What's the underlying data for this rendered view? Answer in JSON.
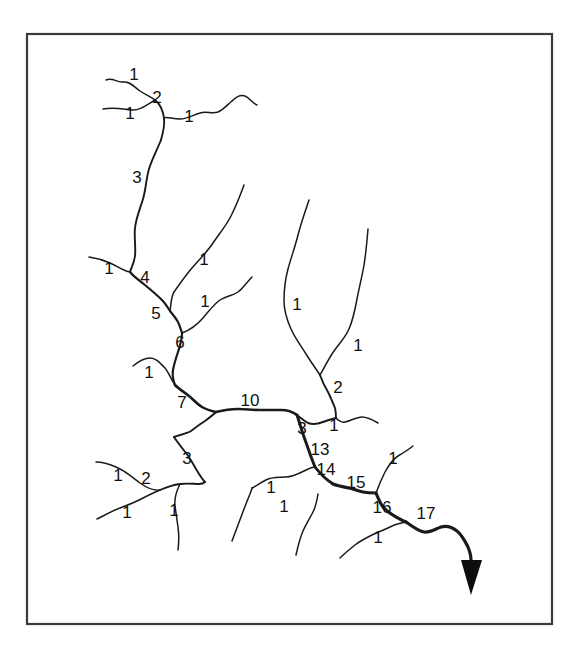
{
  "figure": {
    "background_color": "#ffffff",
    "frame_color": "#3b3b3b",
    "stream_color": "#1a1a1a",
    "label_color": "#111111",
    "arrow_color": "#0d0d0d"
  },
  "frame": {
    "x": 27,
    "y": 34,
    "width": 525,
    "height": 590
  },
  "labels": [
    {
      "id": "lbl-01",
      "text": "1",
      "x": 134,
      "y": 76
    },
    {
      "id": "lbl-02",
      "text": "2",
      "x": 157,
      "y": 99
    },
    {
      "id": "lbl-03",
      "text": "1",
      "x": 130,
      "y": 115
    },
    {
      "id": "lbl-04",
      "text": "1",
      "x": 189,
      "y": 118
    },
    {
      "id": "lbl-05",
      "text": "3",
      "x": 137,
      "y": 179
    },
    {
      "id": "lbl-06",
      "text": "1",
      "x": 109,
      "y": 270
    },
    {
      "id": "lbl-07",
      "text": "4",
      "x": 145,
      "y": 279
    },
    {
      "id": "lbl-08",
      "text": "1",
      "x": 204,
      "y": 261
    },
    {
      "id": "lbl-09",
      "text": "5",
      "x": 156,
      "y": 315
    },
    {
      "id": "lbl-10",
      "text": "1",
      "x": 205,
      "y": 303
    },
    {
      "id": "lbl-11",
      "text": "6",
      "x": 180,
      "y": 344
    },
    {
      "id": "lbl-12",
      "text": "1",
      "x": 149,
      "y": 374
    },
    {
      "id": "lbl-13",
      "text": "7",
      "x": 182,
      "y": 404
    },
    {
      "id": "lbl-14",
      "text": "10",
      "x": 250,
      "y": 402
    },
    {
      "id": "lbl-15",
      "text": "1",
      "x": 297,
      "y": 306
    },
    {
      "id": "lbl-16",
      "text": "1",
      "x": 358,
      "y": 347
    },
    {
      "id": "lbl-17",
      "text": "2",
      "x": 338,
      "y": 389
    },
    {
      "id": "lbl-18",
      "text": "3",
      "x": 302,
      "y": 430
    },
    {
      "id": "lbl-19",
      "text": "1",
      "x": 334,
      "y": 427
    },
    {
      "id": "lbl-20",
      "text": "13",
      "x": 320,
      "y": 451
    },
    {
      "id": "lbl-21",
      "text": "14",
      "x": 326,
      "y": 471
    },
    {
      "id": "lbl-22",
      "text": "15",
      "x": 356,
      "y": 484
    },
    {
      "id": "lbl-23",
      "text": "1",
      "x": 393,
      "y": 460
    },
    {
      "id": "lbl-24",
      "text": "16",
      "x": 382,
      "y": 509
    },
    {
      "id": "lbl-25",
      "text": "17",
      "x": 426,
      "y": 515
    },
    {
      "id": "lbl-26",
      "text": "1",
      "x": 271,
      "y": 489
    },
    {
      "id": "lbl-27",
      "text": "1",
      "x": 284,
      "y": 508
    },
    {
      "id": "lbl-28",
      "text": "1",
      "x": 378,
      "y": 539
    },
    {
      "id": "lbl-29",
      "text": "3",
      "x": 187,
      "y": 460
    },
    {
      "id": "lbl-30",
      "text": "2",
      "x": 146,
      "y": 480
    },
    {
      "id": "lbl-31",
      "text": "1",
      "x": 118,
      "y": 477
    },
    {
      "id": "lbl-32",
      "text": "1",
      "x": 127,
      "y": 514
    },
    {
      "id": "lbl-33",
      "text": "1",
      "x": 174,
      "y": 512
    }
  ],
  "streams": [
    {
      "id": "seg-headwater-nw-a",
      "order": "1",
      "path": "M106,80 C113,77 117,83 123,82 C130,81 134,87 140,91 C146,95 150,96 155,100"
    },
    {
      "id": "seg-headwater-nw-b",
      "order": "1",
      "path": "M103,109 C114,107 122,109 131,110 C140,111 148,104 155,100"
    },
    {
      "id": "seg-order2-upper",
      "order": "2",
      "path": "M155,100 C160,104 163,111 164,118 C165,126 163,133 161,140"
    },
    {
      "id": "seg-headwater-ne-top",
      "order": "1",
      "path": "M232,101 C227,105 223,110 218,112 C212,114 206,111 200,113 C193,115 187,119 180,119 C172,119 167,116 164,118"
    },
    {
      "id": "seg-headwater-ne-tip",
      "order": "1",
      "path": "M232,101 C236,97 240,94 245,96 C250,98 252,103 257,105"
    },
    {
      "id": "seg-order3-upper",
      "order": "3",
      "path": "M161,140 C157,150 152,159 149,169 C146,179 146,189 143,199 C140,209 136,218 135,228 C134,238 136,247 135,256 C134,264 131,268 130,272"
    },
    {
      "id": "seg-left-trib-at-4",
      "order": "1",
      "path": "M89,257 C96,258 103,260 110,263 C117,266 124,271 130,272"
    },
    {
      "id": "seg-order4",
      "order": "4",
      "path": "M130,272 C134,277 139,280 145,285 C151,290 157,295 162,300 C166,304 168,308 170,311"
    },
    {
      "id": "seg-right-trib-to-4",
      "order": "1",
      "path": "M244,185 C240,196 236,206 231,216 C226,226 219,234 213,243 C207,252 199,260 192,268 C185,276 179,285 174,292 C171,297 171,305 170,311"
    },
    {
      "id": "seg-order5",
      "order": "5",
      "path": "M170,311 C173,315 176,318 178,322 C180,326 181,330 182,333"
    },
    {
      "id": "seg-trib-to-6",
      "order": "1",
      "path": "M252,277 C247,282 243,288 238,292 C232,296 226,296 220,300 C214,304 209,311 203,318 C197,325 190,330 182,333"
    },
    {
      "id": "seg-order6",
      "order": "6",
      "path": "M182,333 C182,340 180,346 178,352 C176,358 174,364 173,370 C172,376 173,380 175,385"
    },
    {
      "id": "seg-trib-to-7",
      "order": "1",
      "path": "M133,366 C139,361 144,358 150,358 C156,358 160,363 165,368 C169,373 172,381 175,385"
    },
    {
      "id": "seg-order7",
      "order": "7",
      "path": "M175,385 C179,389 184,392 189,396 C194,400 197,404 202,407 C207,410 212,411 216,412"
    },
    {
      "id": "seg-order3-lower-left",
      "order": "3",
      "path": "M174,437 C178,443 182,448 186,453 C190,458 193,464 196,469 C199,474 202,479 205,482"
    },
    {
      "id": "seg-order3-up-to-junction",
      "order": "3",
      "path": "M216,412 C213,415 209,418 205,421 C200,424 195,428 191,431 C186,434 179,435 174,437"
    },
    {
      "id": "seg-order2-bl",
      "order": "2",
      "path": "M160,490 C167,487 173,485 180,484 C187,483 194,484 199,484 C203,484 204,483 205,482"
    },
    {
      "id": "seg-bl-head-a",
      "order": "1",
      "path": "M96,462 C103,462 109,464 116,467 C124,470 132,477 140,483 C147,488 154,491 160,490"
    },
    {
      "id": "seg-bl-head-b",
      "order": "1",
      "path": "M97,519 C105,515 112,511 120,508 C128,505 136,502 143,498 C149,495 155,492 160,490"
    },
    {
      "id": "seg-bl-head-c",
      "order": "1",
      "path": "M178,550 C179,542 179,534 178,527 C177,520 176,513 175,506 C174,498 176,492 180,484"
    },
    {
      "id": "seg-mid-trunk-10",
      "order": "10",
      "path": "M216,412 C224,410 231,409 238,409 C245,409 252,410 259,410 C267,410 274,410 281,410 C288,410 293,412 297,415"
    },
    {
      "id": "seg-east-head-left",
      "order": "1",
      "path": "M309,200 C305,212 301,223 298,235 C295,247 291,258 288,269 C285,280 284,291 284,301 C284,311 287,320 291,329 C295,338 301,346 306,354 C311,362 316,369 320,375"
    },
    {
      "id": "seg-east-head-right",
      "order": "1",
      "path": "M368,229 C367,241 366,253 364,265 C362,277 359,288 357,299 C355,310 353,320 349,329 C345,338 339,344 334,351 C329,358 324,368 320,375"
    },
    {
      "id": "seg-order2-east",
      "order": "2",
      "path": "M320,375 C322,381 325,387 328,392 C331,398 333,403 335,408 C336,412 336,415 336,418"
    },
    {
      "id": "seg-order3-east-junction",
      "order": "3",
      "path": "M297,415 C301,418 304,421 308,423 C313,425 318,424 323,422 C328,420 332,419 336,418"
    },
    {
      "id": "seg-east-small-trib",
      "order": "1",
      "path": "M378,423 C373,420 368,417 362,417 C356,417 351,421 345,422 C341,423 338,420 336,418"
    },
    {
      "id": "seg-order13",
      "order": "13",
      "path": "M297,415 C299,421 301,428 303,434 C305,440 307,445 309,451 C311,457 313,462 315,467"
    },
    {
      "id": "seg-order14",
      "order": "14",
      "path": "M315,467 C318,471 321,474 324,477 C327,480 330,482 333,484"
    },
    {
      "id": "seg-trib-to-14-left",
      "order": "1",
      "path": "M252,488 C258,485 263,481 268,479 C274,477 280,477 286,477 C293,477 300,473 306,470 C310,468 313,467 315,467"
    },
    {
      "id": "seg-trib-to-14-far-left",
      "order": "1",
      "path": "M232,541 C235,533 238,525 241,517 C244,509 247,501 250,494 C251,491 252,489 252,488"
    },
    {
      "id": "seg-order15",
      "order": "15",
      "path": "M333,484 C338,486 344,487 349,488 C354,489 358,491 363,492 C368,493 372,493 376,493"
    },
    {
      "id": "seg-trib-to-15",
      "order": "1",
      "path": "M413,446 C408,450 403,453 398,456 C393,459 389,465 385,472 C382,478 379,485 376,493"
    },
    {
      "id": "seg-order16",
      "order": "16",
      "path": "M376,493 C378,498 380,503 383,507 C386,511 391,514 396,517 C400,519 403,521 406,522"
    },
    {
      "id": "seg-trib-to-16",
      "order": "1",
      "path": "M340,558 C345,553 350,549 355,545 C360,541 366,538 372,535 C378,532 384,530 390,527 C396,524 402,523 406,522"
    },
    {
      "id": "seg-order17-outlet",
      "order": "17",
      "path": "M406,522 C412,526 418,531 424,532 C430,533 435,529 441,527 C447,525 452,527 457,531 C462,535 465,541 468,547 C470,552 471,556 471,560"
    },
    {
      "id": "seg-bl-lower-right-head",
      "order": "1",
      "path": "M296,555 C298,546 300,538 303,531 C306,524 310,518 313,512 C316,506 317,500 318,494"
    }
  ],
  "outlet_arrow": {
    "id": "outlet-arrowhead",
    "points": "461,560 482,560 471,595",
    "tip_x": 471,
    "tip_y": 595
  }
}
